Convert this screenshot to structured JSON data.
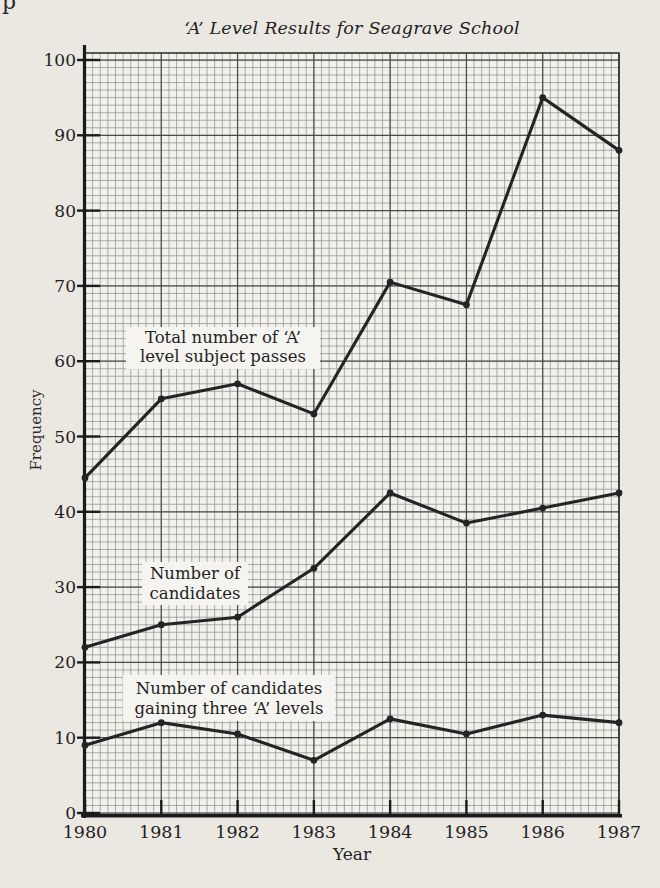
{
  "page": {
    "edge_artifact": "p"
  },
  "chart_data": {
    "type": "line",
    "title": "‘A’ Level Results for Seagrave School",
    "xlabel": "Year",
    "ylabel": "Frequency",
    "x": [
      1980,
      1981,
      1982,
      1983,
      1984,
      1985,
      1986,
      1987
    ],
    "ylim": [
      0,
      100
    ],
    "ytick_step": 10,
    "yticks": [
      0,
      10,
      20,
      30,
      40,
      50,
      60,
      70,
      80,
      90,
      100
    ],
    "grid": "fine graph paper, minor lines every 1 unit vertically and 10 per year horizontally",
    "legend_position": "inline labels on white boxes",
    "series": [
      {
        "name": "Total number of ‘A’ level subject passes",
        "label_lines": [
          "Total number of ‘A’",
          "level subject passes"
        ],
        "values": [
          44.5,
          55,
          57,
          53,
          70.5,
          67.5,
          95,
          88
        ]
      },
      {
        "name": "Number of candidates",
        "label_lines": [
          "Number of",
          "candidates"
        ],
        "values": [
          22,
          25,
          26,
          32.5,
          42.5,
          38.5,
          40.5,
          42.5
        ]
      },
      {
        "name": "Number of candidates gaining three ‘A’ levels",
        "label_lines": [
          "Number of candidates",
          "gaining three ‘A’ levels"
        ],
        "values": [
          9,
          12,
          10.5,
          7,
          12.5,
          10.5,
          13,
          12
        ]
      }
    ],
    "colors": {
      "ink": "#242424",
      "paper": "#ebe8e2",
      "plot_bg": "#f3f1ec",
      "grid_minor": "#747474",
      "grid_major": "#3c3c3c",
      "label_bg": "#f6f4f0",
      "text": "#1f1f1f"
    }
  }
}
